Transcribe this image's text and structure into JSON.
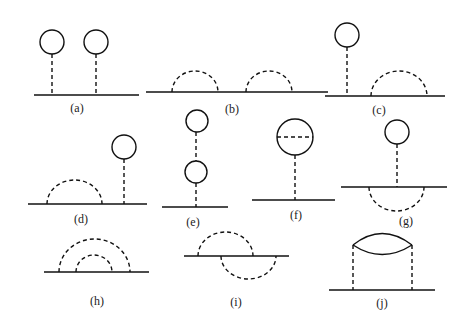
{
  "figure": {
    "panels": [
      {
        "id": "a",
        "label": "(a)",
        "description": "two tadpole loops on a line"
      },
      {
        "id": "b",
        "label": "(b)",
        "description": "two separate rainbow self-energy arcs"
      },
      {
        "id": "c",
        "label": "(c)",
        "description": "tadpole loop and rainbow arc"
      },
      {
        "id": "d",
        "label": "(d)",
        "description": "rainbow arc and tadpole loop"
      },
      {
        "id": "e",
        "label": "(e)",
        "description": "double tadpole chain"
      },
      {
        "id": "f",
        "label": "(f)",
        "description": "tadpole loop with internal dashed line"
      },
      {
        "id": "g",
        "label": "(g)",
        "description": "tadpole with arc below line"
      },
      {
        "id": "h",
        "label": "(h)",
        "description": "nested rainbow arcs"
      },
      {
        "id": "i",
        "label": "(i)",
        "description": "crossed arcs above and below line"
      },
      {
        "id": "j",
        "label": "(j)",
        "description": "bubble connected by two dashed lines"
      }
    ]
  },
  "colors": {
    "stroke": "#111111",
    "background": "#ffffff"
  }
}
